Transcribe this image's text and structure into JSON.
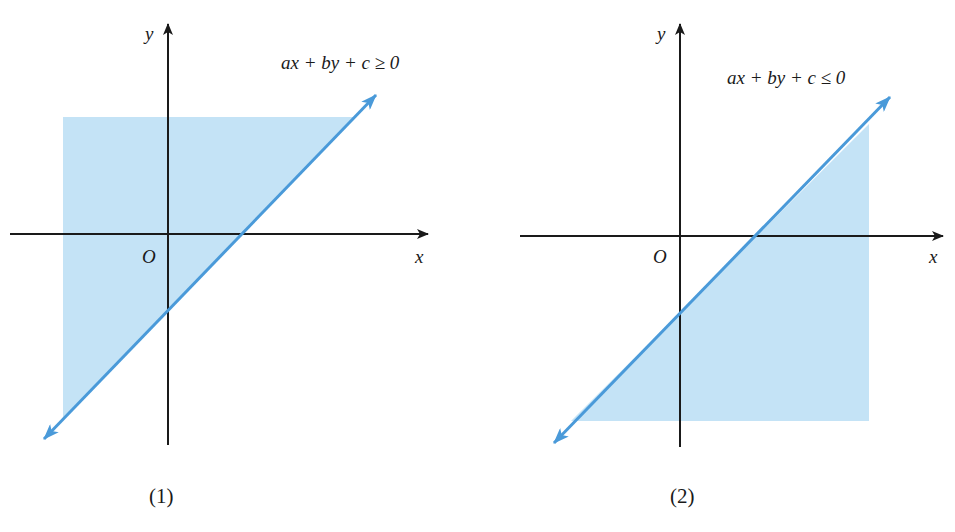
{
  "figure": {
    "panels": [
      {
        "id": "1",
        "caption": "(1)",
        "inequality_label": "ax + by + c ≥ 0",
        "inequality_parts": {
          "lhs": "ax + by + c",
          "op": "≥",
          "rhs": "0"
        },
        "axis_labels": {
          "x": "x",
          "y": "y",
          "origin": "O"
        },
        "shaded_side": "above-left of line"
      },
      {
        "id": "2",
        "caption": "(2)",
        "inequality_label": "ax + by + c ≤ 0",
        "inequality_parts": {
          "lhs": "ax + by + c",
          "op": "≤",
          "rhs": "0"
        },
        "axis_labels": {
          "x": "x",
          "y": "y",
          "origin": "O"
        },
        "shaded_side": "below-right of line"
      }
    ],
    "colors": {
      "shade": "#c4e3f6",
      "line": "#4a9ad9",
      "axis": "#1a1a1a",
      "text": "#1a1a1a"
    }
  }
}
